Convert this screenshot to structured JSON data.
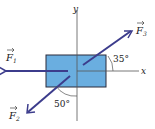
{
  "diagram": {
    "type": "free-body force diagram",
    "box_color": "#6aaee0",
    "arrow_color": "#3c3c8c",
    "axes": {
      "x_label": "x",
      "y_label": "y"
    },
    "forces": [
      {
        "name": "F1",
        "label": "F",
        "subscript": "1",
        "direction": "left along -x axis"
      },
      {
        "name": "F2",
        "label": "F",
        "subscript": "2",
        "direction": "down-left",
        "angle_label": "50°",
        "angle_reference": "from -y axis"
      },
      {
        "name": "F3",
        "label": "F",
        "subscript": "3",
        "direction": "up-right",
        "angle_label": "35°",
        "angle_reference": "from +x axis"
      }
    ]
  }
}
